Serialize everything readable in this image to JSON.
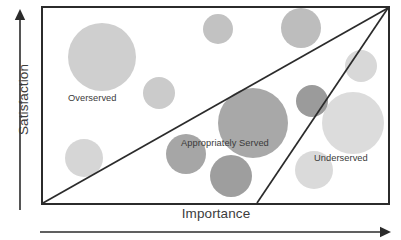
{
  "axes": {
    "y_label": "Satisfaction",
    "x_label": "Importance",
    "y_arrow_icon": "arrow-up-icon",
    "x_arrow_icon": "arrow-right-icon"
  },
  "regions": [
    {
      "key": "overserved",
      "label": "Overserved"
    },
    {
      "key": "appropriately_served",
      "label": "Appropriately Served"
    },
    {
      "key": "underserved",
      "label": "Underserved"
    }
  ],
  "colors": {
    "frame": "#2b2b2b",
    "divider_line": "#2b2b2b",
    "axis_arrow": "#2b2b2b",
    "text": "#3a3a3a",
    "bubble_light": "#dcdcdc",
    "bubble_mid_light": "#cfcfcf",
    "bubble_mid": "#bdbdbd",
    "bubble_mid_dark": "#a8a8a8",
    "bubble_dark": "#959595",
    "background": "#ffffff"
  },
  "chart_data": {
    "type": "scatter",
    "title": "",
    "xlabel": "Importance",
    "ylabel": "Satisfaction",
    "xlim": [
      0,
      100
    ],
    "ylim": [
      0,
      100
    ],
    "grid": false,
    "legend": "none",
    "annotations": [
      {
        "text": "Overserved",
        "x": 16,
        "y": 57
      },
      {
        "text": "Appropriately Served",
        "x": 49,
        "y": 34
      },
      {
        "text": "Underserved",
        "x": 87,
        "y": 26
      }
    ],
    "dividers": [
      {
        "name": "overserved-boundary",
        "from": [
          0,
          0
        ],
        "to": [
          100,
          100
        ]
      },
      {
        "name": "underserved-boundary",
        "from": [
          62,
          0
        ],
        "to": [
          100,
          100
        ]
      }
    ],
    "points": [
      {
        "id": "b1",
        "x": 17,
        "y": 74,
        "r": 27,
        "color": "#cfcfcf",
        "region": "overserved"
      },
      {
        "id": "b2",
        "x": 16,
        "y": 23,
        "r": 14,
        "color": "#d6d6d6",
        "region": "overserved"
      },
      {
        "id": "b3",
        "x": 37,
        "y": 56,
        "r": 12,
        "color": "#cbcbcb",
        "region": "overserved"
      },
      {
        "id": "b4",
        "x": 49,
        "y": 88,
        "r": 13,
        "color": "#c2c2c2",
        "region": "overserved"
      },
      {
        "id": "b5",
        "x": 75,
        "y": 89,
        "r": 16,
        "color": "#bdbdbd",
        "region": "overserved"
      },
      {
        "id": "b6",
        "x": 95,
        "y": 67,
        "r": 12,
        "color": "#d8d8d8",
        "region": "underserved"
      },
      {
        "id": "b7",
        "x": 56,
        "y": 40,
        "r": 28,
        "color": "#a8a8a8",
        "region": "appropriately_served"
      },
      {
        "id": "b8",
        "x": 76,
        "y": 50,
        "r": 12,
        "color": "#9b9b9b",
        "region": "appropriately_served"
      },
      {
        "id": "b9",
        "x": 39,
        "y": 21,
        "r": 15,
        "color": "#a6a6a6",
        "region": "appropriately_served"
      },
      {
        "id": "b10",
        "x": 51,
        "y": 12,
        "r": 16,
        "color": "#9e9e9e",
        "region": "appropriately_served"
      },
      {
        "id": "b11",
        "x": 90,
        "y": 37,
        "r": 24,
        "color": "#dcdcdc",
        "region": "underserved"
      },
      {
        "id": "b12",
        "x": 78,
        "y": 14,
        "r": 15,
        "color": "#dadada",
        "region": "underserved"
      }
    ]
  },
  "bubbles": [
    {
      "name": "bubble-overserved-large",
      "cx": 61,
      "cy": 51,
      "r": 34,
      "fill": "#cfcfcf"
    },
    {
      "name": "bubble-overserved-lower-left",
      "cx": 43,
      "cy": 152,
      "r": 19,
      "fill": "#d6d6d6"
    },
    {
      "name": "bubble-overserved-mid",
      "cx": 118,
      "cy": 87,
      "r": 16,
      "fill": "#cbcbcb"
    },
    {
      "name": "bubble-top-center",
      "cx": 177,
      "cy": 23,
      "r": 15,
      "fill": "#c2c2c2"
    },
    {
      "name": "bubble-top-right",
      "cx": 260,
      "cy": 22,
      "r": 20,
      "fill": "#bdbdbd"
    },
    {
      "name": "bubble-right-upper",
      "cx": 320,
      "cy": 60,
      "r": 16,
      "fill": "#d8d8d8"
    },
    {
      "name": "bubble-appropriate-large",
      "cx": 212,
      "cy": 117,
      "r": 35,
      "fill": "#a8a8a8"
    },
    {
      "name": "bubble-appropriate-small-right",
      "cx": 271,
      "cy": 95,
      "r": 16,
      "fill": "#9b9b9b"
    },
    {
      "name": "bubble-appropriate-lower-left",
      "cx": 145,
      "cy": 148,
      "r": 20,
      "fill": "#a6a6a6"
    },
    {
      "name": "bubble-appropriate-lower-mid",
      "cx": 190,
      "cy": 170,
      "r": 21,
      "fill": "#9e9e9e"
    },
    {
      "name": "bubble-underserved-large",
      "cx": 312,
      "cy": 117,
      "r": 31,
      "fill": "#dcdcdc"
    },
    {
      "name": "bubble-underserved-small",
      "cx": 273,
      "cy": 164,
      "r": 19,
      "fill": "#dadada"
    }
  ],
  "frame": {
    "x": 1,
    "y": 1,
    "width": 347,
    "height": 197
  }
}
